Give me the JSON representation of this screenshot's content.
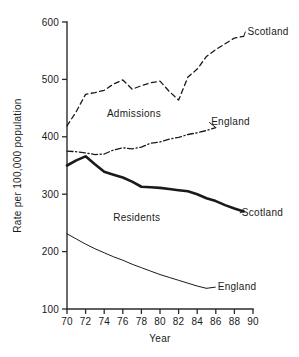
{
  "chart_data": {
    "type": "line",
    "title": "",
    "xlabel": "Year",
    "ylabel": "Rate per 100,000 population",
    "xlim": [
      70,
      90
    ],
    "ylim": [
      100,
      600
    ],
    "xticks": [
      "70",
      "72",
      "74",
      "76",
      "78",
      "80",
      "82",
      "84",
      "86",
      "88",
      "90"
    ],
    "yticks": [
      "100",
      "200",
      "300",
      "400",
      "500",
      "600"
    ],
    "grid": false,
    "legend_position": "inline-right-labels",
    "group_annotations": [
      {
        "text": "Admissions",
        "x": 77.2,
        "y": 435
      },
      {
        "text": "Residents",
        "x": 77.5,
        "y": 253
      }
    ],
    "series": [
      {
        "name": "Scotland",
        "group": "Admissions",
        "style": "dashed",
        "label": "Scotland",
        "label_x": 89.4,
        "label_y": 578,
        "x": [
          70,
          71,
          72,
          73,
          74,
          75,
          76,
          77,
          78,
          79,
          80,
          81,
          82,
          83,
          84,
          85,
          86,
          87,
          88,
          89
        ],
        "values": [
          419,
          444,
          474,
          477,
          481,
          492,
          499,
          483,
          489,
          494,
          497,
          479,
          464,
          504,
          518,
          540,
          552,
          562,
          572,
          575
        ]
      },
      {
        "name": "England",
        "group": "Admissions",
        "style": "dash-dot",
        "label": "England",
        "label_x": 85.5,
        "label_y": 420,
        "x": [
          70,
          71,
          72,
          73,
          74,
          75,
          76,
          77,
          78,
          79,
          80,
          81,
          82,
          83,
          84,
          85,
          86
        ],
        "values": [
          375,
          374,
          372,
          369,
          370,
          377,
          381,
          379,
          382,
          389,
          391,
          396,
          399,
          404,
          407,
          411,
          416
        ]
      },
      {
        "name": "Scotland",
        "group": "Residents",
        "style": "bold-solid",
        "label": "Scotland",
        "label_x": 88.8,
        "label_y": 262,
        "x": [
          70,
          71,
          72,
          73,
          74,
          75,
          76,
          77,
          78,
          79,
          80,
          81,
          82,
          83,
          84,
          85,
          86,
          87,
          88,
          89
        ],
        "values": [
          350,
          359,
          366,
          352,
          339,
          334,
          329,
          322,
          313,
          312,
          311,
          309,
          307,
          305,
          300,
          293,
          288,
          281,
          275,
          270
        ]
      },
      {
        "name": "England",
        "group": "Residents",
        "style": "thin-solid",
        "label": "England",
        "label_x": 86.2,
        "label_y": 133,
        "x": [
          70,
          71,
          72,
          73,
          74,
          75,
          76,
          77,
          78,
          79,
          80,
          81,
          82,
          83,
          84,
          85
        ],
        "values": [
          231,
          222,
          213,
          205,
          198,
          191,
          185,
          178,
          172,
          166,
          160,
          155,
          150,
          145,
          140,
          136
        ]
      }
    ]
  }
}
